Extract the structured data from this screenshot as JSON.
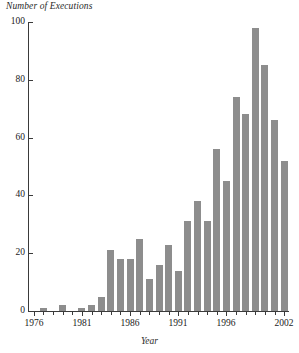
{
  "chart_data": {
    "type": "bar",
    "title": "",
    "xlabel": "Year",
    "ylabel": "Number of Executions",
    "ylim": [
      0,
      100
    ],
    "yticks": [
      0,
      20,
      40,
      60,
      80,
      100
    ],
    "xlim": [
      1976,
      2002
    ],
    "xticks": [
      1976,
      1981,
      1986,
      1991,
      1996,
      2002
    ],
    "grid": false,
    "legend": null,
    "bar_color": "#8d8d8d",
    "axis_color": "#3a3a3a",
    "categories": [
      "1976",
      "1977",
      "1978",
      "1979",
      "1980",
      "1981",
      "1982",
      "1983",
      "1984",
      "1985",
      "1986",
      "1987",
      "1988",
      "1989",
      "1990",
      "1991",
      "1992",
      "1993",
      "1994",
      "1995",
      "1996",
      "1997",
      "1998",
      "1999",
      "2000",
      "2001",
      "2002"
    ],
    "values": [
      0,
      1,
      0,
      2,
      0,
      1,
      2,
      5,
      21,
      18,
      18,
      25,
      11,
      16,
      23,
      14,
      31,
      38,
      31,
      56,
      45,
      74,
      68,
      98,
      85,
      66,
      52
    ]
  },
  "axes": {
    "y_title": "Number of Executions",
    "x_title": "Year",
    "y_tick_labels": [
      "0",
      "20",
      "40",
      "60",
      "80",
      "100"
    ],
    "x_tick_labels": [
      "1976",
      "1981",
      "1986",
      "1991",
      "1996",
      "2002"
    ]
  }
}
